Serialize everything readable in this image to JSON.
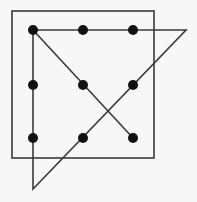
{
  "diagram": {
    "colors": {
      "background": "#f7f7f7",
      "stroke": "#3a3a3a",
      "dot": "#111111"
    },
    "box": {
      "x": 12,
      "y": 11,
      "w": 142,
      "h": 147
    },
    "dots": [
      {
        "x": 33,
        "y": 30
      },
      {
        "x": 83,
        "y": 30
      },
      {
        "x": 133,
        "y": 30
      },
      {
        "x": 33,
        "y": 85
      },
      {
        "x": 83,
        "y": 85
      },
      {
        "x": 133,
        "y": 85
      },
      {
        "x": 33,
        "y": 138
      },
      {
        "x": 83,
        "y": 138
      },
      {
        "x": 133,
        "y": 138
      }
    ],
    "path": [
      [
        33,
        30
      ],
      [
        186,
        30
      ],
      [
        33,
        189
      ],
      [
        33,
        30
      ],
      [
        133,
        138
      ]
    ]
  }
}
